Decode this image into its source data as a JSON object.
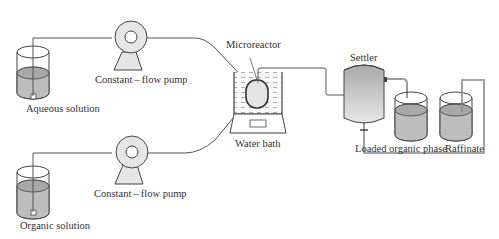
{
  "labels": {
    "aqueous_solution": "Aqueous solution",
    "organic_solution": "Organic solution",
    "pump_top": "Constant – flow pump",
    "pump_bottom": "Constant – flow pump",
    "microreactor": "Microreactor",
    "water_bath": "Water bath",
    "settler": "Settler",
    "loaded_organic_phase": "Loaded organic phase",
    "raffinate": "Raffinate"
  },
  "colors": {
    "liquid": "#bdbdbd",
    "liquid_top": "#a8a8a8",
    "pump_body": "#e6e6e6",
    "line": "#555555",
    "outline": "#444444"
  }
}
